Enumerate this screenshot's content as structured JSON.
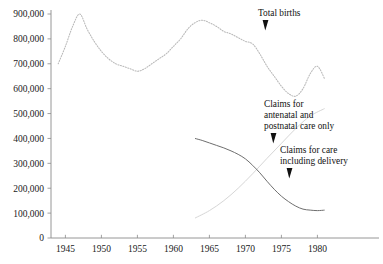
{
  "chart_data": {
    "type": "line",
    "title": "",
    "xlabel": "",
    "ylabel": "",
    "xlim": [
      1943,
      1982
    ],
    "ylim": [
      0,
      900000
    ],
    "grid": false,
    "legend": "annotations-inline",
    "y_ticks": [
      "0",
      "100,000",
      "200,000",
      "300,000",
      "400,000",
      "500,000",
      "600,000",
      "700,000",
      "800,000",
      "900,000"
    ],
    "y_tick_values": [
      0,
      100000,
      200000,
      300000,
      400000,
      500000,
      600000,
      700000,
      800000,
      900000
    ],
    "x_ticks": [
      "1945",
      "1950",
      "1955",
      "1960",
      "1965",
      "1970",
      "1975",
      "1980"
    ],
    "x_tick_values": [
      1945,
      1950,
      1955,
      1960,
      1965,
      1970,
      1975,
      1980
    ],
    "series": [
      {
        "name": "Total births",
        "style": "dotted",
        "color": "#b9b9b9",
        "x": [
          1944,
          1945,
          1946,
          1947,
          1948,
          1949,
          1950,
          1951,
          1952,
          1953,
          1954,
          1955,
          1956,
          1957,
          1958,
          1959,
          1960,
          1961,
          1962,
          1963,
          1964,
          1965,
          1966,
          1967,
          1968,
          1969,
          1970,
          1971,
          1972,
          1973,
          1974,
          1975,
          1976,
          1977,
          1978,
          1979,
          1980,
          1981
        ],
        "values": [
          700000,
          770000,
          850000,
          900000,
          840000,
          790000,
          750000,
          720000,
          700000,
          690000,
          680000,
          670000,
          680000,
          700000,
          720000,
          740000,
          770000,
          800000,
          840000,
          865000,
          875000,
          865000,
          850000,
          830000,
          820000,
          805000,
          790000,
          780000,
          740000,
          690000,
          650000,
          610000,
          580000,
          570000,
          600000,
          660000,
          690000,
          640000
        ]
      },
      {
        "name": "Claims for care including delivery",
        "style": "solid",
        "color": "#6e6e6e",
        "x": [
          1963,
          1964,
          1965,
          1966,
          1967,
          1968,
          1969,
          1970,
          1971,
          1972,
          1973,
          1974,
          1975,
          1976,
          1977,
          1978,
          1979,
          1980,
          1981
        ],
        "values": [
          400000,
          392000,
          382000,
          372000,
          362000,
          350000,
          336000,
          318000,
          292000,
          262000,
          228000,
          196000,
          168000,
          146000,
          128000,
          116000,
          112000,
          110000,
          112000
        ]
      },
      {
        "name": "Claims for antenatal and postnatal care only",
        "style": "solid-faint",
        "color": "#d6d6d6",
        "x": [
          1963,
          1965,
          1967,
          1969,
          1971,
          1973,
          1975,
          1977,
          1979,
          1981
        ],
        "values": [
          80000,
          110000,
          150000,
          200000,
          258000,
          320000,
          380000,
          440000,
          490000,
          520000
        ]
      }
    ],
    "annotations": [
      {
        "id": "total-births",
        "lines": [
          "Total births"
        ],
        "text_x": 258,
        "text_y": 8,
        "pointer_x": 262,
        "pointer_y": 20,
        "pointer_dir": "down"
      },
      {
        "id": "antenatal-postnatal",
        "lines": [
          "Claims for",
          "antenatal and",
          "postnatal care only"
        ],
        "text_x": 264,
        "text_y": 99,
        "pointer_x": 270,
        "pointer_y": 133,
        "pointer_dir": "down"
      },
      {
        "id": "including-delivery",
        "lines": [
          "Claims for care",
          "including delivery"
        ],
        "text_x": 280,
        "text_y": 145,
        "pointer_x": 286,
        "pointer_y": 168,
        "pointer_dir": "down"
      }
    ]
  }
}
